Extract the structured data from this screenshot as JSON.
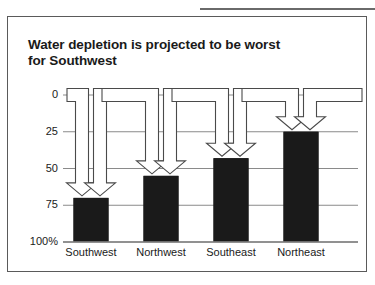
{
  "figure": {
    "background_color": "#ffffff",
    "frame_color": "#5a5a5a",
    "bar_color": "#1a1a1a",
    "grid_color": "#8a8a8a",
    "arrow_color": "#4a4a4a"
  },
  "chart_data": {
    "type": "bar",
    "title": "Water depletion is projected to be worst\nfor Southwest",
    "xlabel": "",
    "ylabel": "",
    "categories": [
      "Southwest",
      "Northwest",
      "Southeast",
      "Northeast"
    ],
    "values": [
      70,
      55,
      43,
      25
    ],
    "value_unit": "%",
    "ylim": [
      0,
      100
    ],
    "y_inverted": true,
    "yticks": [
      0,
      25,
      50,
      75,
      100
    ],
    "ytick_labels": [
      "0",
      "25",
      "50",
      "75",
      "100%"
    ],
    "grid": true,
    "grid_axis": "y",
    "legend": false,
    "annotations": [
      {
        "label": "arrow-to-southwest",
        "target": "Southwest",
        "count": 2
      },
      {
        "label": "arrow-to-northwest",
        "target": "Northwest",
        "count": 2
      },
      {
        "label": "arrow-to-southeast",
        "target": "Southeast",
        "count": 2
      },
      {
        "label": "arrow-to-northeast",
        "target": "Northeast",
        "count": 2
      }
    ]
  }
}
